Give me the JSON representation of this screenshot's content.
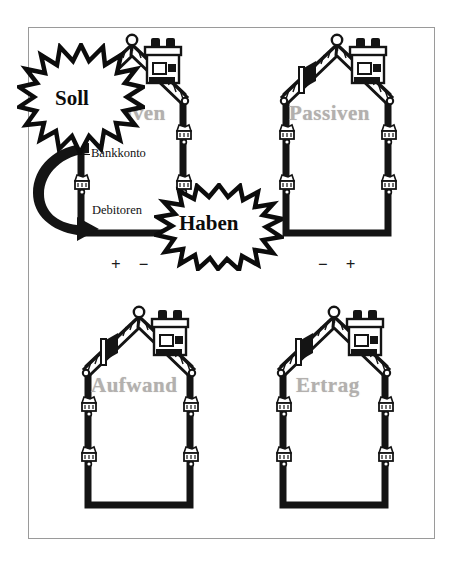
{
  "figure": {
    "title_concept": "Bilanz- und Erfolgskonten als Haeuser",
    "border_color": "#9a9a9a",
    "label_color": "#b3b0ae",
    "ink_color": "#111111",
    "background": "#ffffff"
  },
  "houses": [
    {
      "id": "aktiven",
      "label": "Aktiven",
      "label_visible_fragment": "tiven",
      "signs": [
        "+",
        "−"
      ],
      "entries": [
        {
          "name": "Bankkonto"
        },
        {
          "name": "Debitoren"
        }
      ]
    },
    {
      "id": "passiven",
      "label": "Passiven",
      "signs": [
        "−",
        "+"
      ],
      "entries": []
    },
    {
      "id": "aufwand",
      "label": "Aufwand",
      "signs": [],
      "entries": []
    },
    {
      "id": "ertrag",
      "label": "Ertrag",
      "signs": [],
      "entries": []
    }
  ],
  "bursts": [
    {
      "id": "soll",
      "text": "Soll"
    },
    {
      "id": "haben",
      "text": "Haben"
    }
  ],
  "icons": {
    "house": "house-icon",
    "roof": "tiled-roof-icon",
    "chimney": "chimney-icon",
    "finial": "roof-finial-icon",
    "dormer": "dormer-icon",
    "flowerbox": "flower-box-icon",
    "burst": "starburst-icon",
    "arrow": "curved-arrow-icon"
  }
}
